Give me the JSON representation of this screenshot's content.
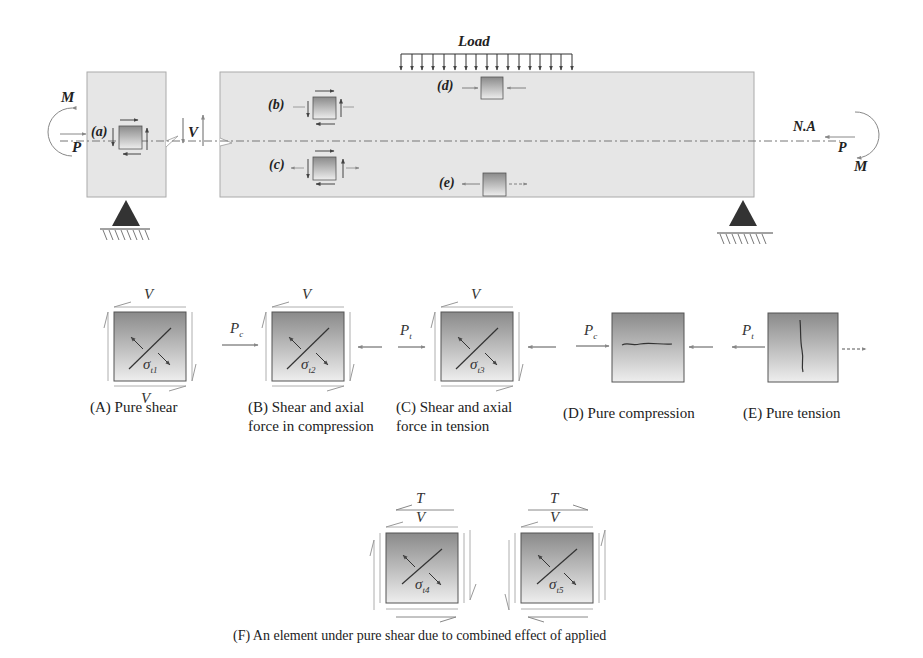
{
  "beam": {
    "load_label": "Load",
    "neutral_axis_label": "N.A",
    "left_moment_label": "M",
    "left_axial_label": "P",
    "right_moment_label": "M",
    "right_axial_label": "P",
    "shear_label": "V",
    "element_labels": [
      "(a)",
      "(b)",
      "(c)",
      "(d)",
      "(e)"
    ]
  },
  "elements": [
    {
      "id": "A",
      "caption_line1": "(A) Pure shear",
      "caption_line2": "",
      "top_label": "V",
      "bottom_label": "V",
      "stress_label": "σ",
      "stress_sub": "t1"
    },
    {
      "id": "B",
      "caption_line1": "(B) Shear and axial",
      "caption_line2": "force in compression",
      "top_label": "V",
      "force_label": "P",
      "force_sub": "c",
      "stress_label": "σ",
      "stress_sub": "t2"
    },
    {
      "id": "C",
      "caption_line1": "(C) Shear and axial",
      "caption_line2": "force in tension",
      "top_label": "V",
      "force_label": "P",
      "force_sub": "t",
      "stress_label": "σ",
      "stress_sub": "t3"
    },
    {
      "id": "D",
      "caption_line1": "(D) Pure compression",
      "caption_line2": "",
      "force_label": "P",
      "force_sub": "c"
    },
    {
      "id": "E",
      "caption_line1": "(E) Pure tension",
      "caption_line2": "",
      "force_label": "P",
      "force_sub": "t"
    }
  ],
  "combined": {
    "items": [
      {
        "top_label": "T",
        "second_label": "V",
        "stress_label": "σ",
        "stress_sub": "t4"
      },
      {
        "top_label": "T",
        "second_label": "V",
        "stress_label": "σ",
        "stress_sub": "t5"
      }
    ],
    "caption": "(F) An element under pure shear due to combined effect of applied"
  },
  "colors": {
    "concrete": "#e6e6e6",
    "support": "#333333",
    "arrow": "#555555"
  }
}
